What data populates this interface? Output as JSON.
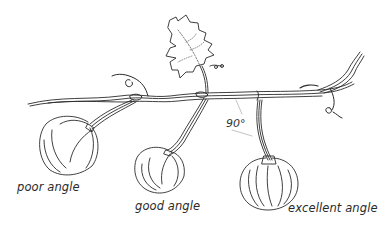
{
  "illustration": {
    "subject": "pumpkin vine with three fruits showing stem angles",
    "labels": {
      "poor": "poor angle",
      "good": "good angle",
      "excellent": "excellent angle"
    },
    "angle_annotation": "90°"
  },
  "colors": {
    "ink": "#2a2a2a",
    "background": "#ffffff"
  }
}
